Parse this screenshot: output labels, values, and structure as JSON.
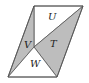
{
  "diagram": {
    "type": "parallelogram-partition",
    "fill_shaded": "#bdbdbd",
    "fill_unshaded": "#ffffff",
    "stroke": "#555555",
    "vertices": {
      "top_left": [
        34,
        6
      ],
      "top_right": [
        83,
        6
      ],
      "bottom_right": [
        57,
        77
      ],
      "bottom_left": [
        8,
        77
      ],
      "inner": [
        34,
        47
      ]
    },
    "regions": [
      {
        "label": "U",
        "shaded": false
      },
      {
        "label": "V",
        "shaded": true
      },
      {
        "label": "T",
        "shaded": true
      },
      {
        "label": "W",
        "shaded": false
      }
    ]
  }
}
